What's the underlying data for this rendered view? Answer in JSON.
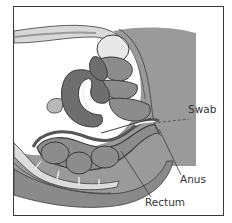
{
  "diagram": {
    "type": "anatomical-cross-section",
    "view": "sagittal pelvis",
    "labels": [
      {
        "id": "swab",
        "text": "Swab"
      },
      {
        "id": "anus",
        "text": "Anus"
      },
      {
        "id": "rectum",
        "text": "Rectum"
      }
    ]
  },
  "colors": {
    "background": "#ffffff",
    "frame": "#3a3a3a",
    "tissue_dark": "#6e6e6e",
    "tissue_mid": "#8c8c8c",
    "tissue_body": "#9a9a9a",
    "tissue_light": "#c4c4c4",
    "tissue_pale": "#e6e6e6",
    "outline": "#3c3c3c",
    "label_text": "#333333"
  }
}
